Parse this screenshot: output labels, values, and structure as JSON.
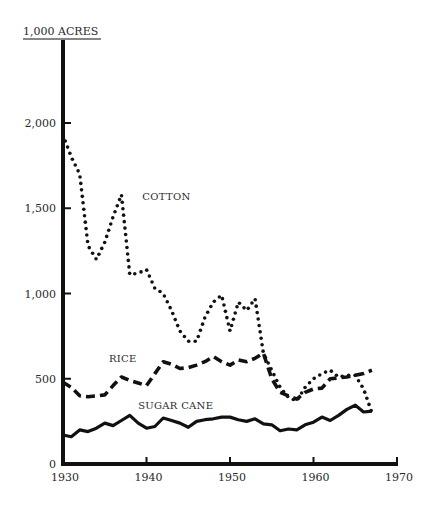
{
  "chart_data": {
    "type": "line",
    "title": "",
    "ylabel": "1,000 ACRES",
    "xlabel": "",
    "xlim": [
      1930,
      1970
    ],
    "ylim": [
      0,
      2000
    ],
    "x_ticks": [
      1930,
      1940,
      1950,
      1960,
      1970
    ],
    "x_tick_labels": [
      "1930",
      "1940",
      "1950",
      "1960",
      "1970"
    ],
    "y_ticks": [
      0,
      500,
      1000,
      1500,
      2000
    ],
    "y_tick_labels": [
      "0",
      "500",
      "1,000",
      "1,500",
      "2,000"
    ],
    "grid": false,
    "legend": "inline labels",
    "series": [
      {
        "name": "COTTON",
        "style": "dotted",
        "x": [
          1930,
          1931,
          1932,
          1933,
          1934,
          1935,
          1936,
          1937,
          1938,
          1939,
          1940,
          1941,
          1942,
          1943,
          1944,
          1945,
          1946,
          1947,
          1948,
          1949,
          1950,
          1951,
          1952,
          1953,
          1954,
          1955,
          1956,
          1957,
          1958,
          1959,
          1960,
          1961,
          1962,
          1963,
          1964,
          1965,
          1966,
          1967
        ],
        "values": [
          1930,
          1800,
          1700,
          1280,
          1200,
          1300,
          1450,
          1580,
          1110,
          1120,
          1140,
          1030,
          1000,
          900,
          780,
          720,
          720,
          860,
          950,
          990,
          780,
          950,
          900,
          970,
          650,
          550,
          450,
          390,
          370,
          450,
          500,
          530,
          550,
          510,
          520,
          520,
          440,
          300
        ]
      },
      {
        "name": "RICE",
        "style": "dashed",
        "x": [
          1930,
          1931,
          1932,
          1933,
          1934,
          1935,
          1936,
          1937,
          1938,
          1939,
          1940,
          1941,
          1942,
          1943,
          1944,
          1945,
          1946,
          1947,
          1948,
          1949,
          1950,
          1951,
          1952,
          1953,
          1954,
          1955,
          1956,
          1957,
          1958,
          1959,
          1960,
          1961,
          1962,
          1963,
          1964,
          1965,
          1966,
          1967
        ],
        "values": [
          480,
          450,
          400,
          395,
          400,
          405,
          460,
          510,
          490,
          475,
          460,
          530,
          600,
          585,
          560,
          565,
          580,
          600,
          630,
          600,
          580,
          610,
          600,
          620,
          650,
          500,
          420,
          400,
          380,
          420,
          440,
          445,
          500,
          505,
          510,
          520,
          530,
          550
        ]
      },
      {
        "name": "SUGAR CANE",
        "style": "solid",
        "x": [
          1930,
          1931,
          1932,
          1933,
          1934,
          1935,
          1936,
          1937,
          1938,
          1939,
          1940,
          1941,
          1942,
          1943,
          1944,
          1945,
          1946,
          1947,
          1948,
          1949,
          1950,
          1951,
          1952,
          1953,
          1954,
          1955,
          1956,
          1957,
          1958,
          1959,
          1960,
          1961,
          1962,
          1963,
          1964,
          1965,
          1966,
          1967
        ],
        "values": [
          170,
          160,
          200,
          190,
          210,
          240,
          225,
          255,
          285,
          240,
          210,
          220,
          270,
          255,
          240,
          215,
          250,
          260,
          265,
          275,
          275,
          260,
          250,
          265,
          235,
          230,
          195,
          205,
          200,
          230,
          245,
          275,
          255,
          285,
          320,
          345,
          305,
          310
        ]
      }
    ],
    "annotations": [
      {
        "text": "COTTON",
        "series": "COTTON",
        "x": 1939.5,
        "y": 1550
      },
      {
        "text": "RICE",
        "series": "RICE",
        "x": 1935.5,
        "y": 600
      },
      {
        "text": "SUGAR CANE",
        "series": "SUGAR CANE",
        "x": 1939,
        "y": 320
      }
    ],
    "colors": {
      "ink": "#111111",
      "background": "#ffffff"
    }
  }
}
